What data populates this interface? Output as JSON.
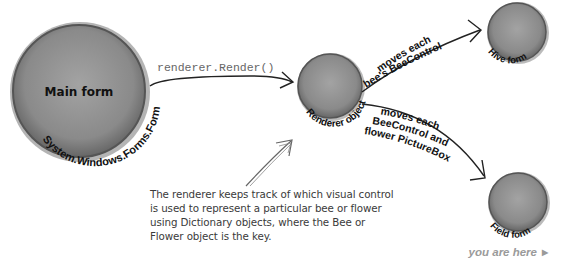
{
  "nodes": {
    "main_form": {
      "label": "Main form",
      "type_label": "System.Windows.Forms.Form"
    },
    "renderer": {
      "label": "Renderer object"
    },
    "hive_form": {
      "label": "Hive form"
    },
    "field_form": {
      "label": "Field form"
    }
  },
  "edges": {
    "main_to_renderer": {
      "label": "renderer.Render()"
    },
    "renderer_to_hive": {
      "label_line1": "moves each",
      "label_line2": "bee's BeeControl"
    },
    "renderer_to_field": {
      "label_line1": "moves each",
      "label_line2": "BeeControl and",
      "label_line3": "flower PictureBox"
    }
  },
  "annotation": {
    "text": "The renderer keeps track of which visual control is used to represent a particular bee or flower using Dictionary objects, where the Bee or Flower object is the key."
  },
  "footer": {
    "text": "you are here",
    "icon": "triangle-right-icon"
  },
  "colors": {
    "circle_fill": "#8e8e8e",
    "circle_edge": "#5a5a5a",
    "arrow": "#222222"
  }
}
